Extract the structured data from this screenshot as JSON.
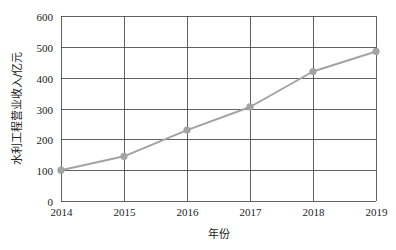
{
  "chart_data": {
    "type": "line",
    "title": "",
    "xlabel": "年份",
    "ylabel": "水利工程营业收入/亿元",
    "x": [
      2014,
      2015,
      2016,
      2017,
      2018,
      2019
    ],
    "categories": [
      "2014",
      "2015",
      "2016",
      "2017",
      "2018",
      "2019"
    ],
    "series": [
      {
        "name": "水利工程营业收入",
        "values": [
          100,
          145,
          230,
          305,
          420,
          485
        ]
      }
    ],
    "ylim": [
      0,
      600
    ],
    "yticks": [
      0,
      100,
      200,
      300,
      400,
      500,
      600
    ],
    "xlim": [
      2014,
      2019
    ],
    "grid": true,
    "legend": "none",
    "colors": {
      "line": "#a3a3a3",
      "marker": "#a3a3a3",
      "grid": "#3a3a3a"
    }
  }
}
